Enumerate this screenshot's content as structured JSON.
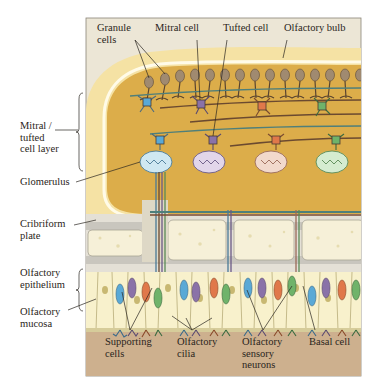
{
  "figure": {
    "top_labels": {
      "granule_cells": "Granule\ncells",
      "mitral_cell": "Mitral cell",
      "tufted_cell": "Tufted cell",
      "olfactory_bulb": "Olfactory bulb"
    },
    "left_labels": {
      "mitral_tufted_layer": "Mitral /\ntufted\ncell layer",
      "glomerulus": "Glomerulus",
      "cribriform_plate": "Cribriform\nplate",
      "olfactory_epithelium": "Olfactory\nepithelium",
      "olfactory_mucosa": "Olfactory\nmucosa"
    },
    "bottom_labels": {
      "supporting_cells": "Supporting\ncells",
      "olfactory_cilia": "Olfactory\ncilia",
      "olfactory_sensory_neurons": "Olfactory\nsensory\nneurons",
      "basal_cell": "Basal cell"
    },
    "colors": {
      "frame_bg": "#ece6d6",
      "bulb_outer": "#f5e2a4",
      "bulb_inner": "#dcad4a",
      "bone": "#f6f0d8",
      "bone_gray": "#c9c6be",
      "epithelium": "#f8f1cc",
      "mucosa": "#cdb08e",
      "neuron_blue": "#5aa9d6",
      "neuron_purple": "#8a72a8",
      "neuron_orange": "#e0784a",
      "neuron_green": "#6fb36a",
      "axon": "#6b5a48"
    }
  }
}
